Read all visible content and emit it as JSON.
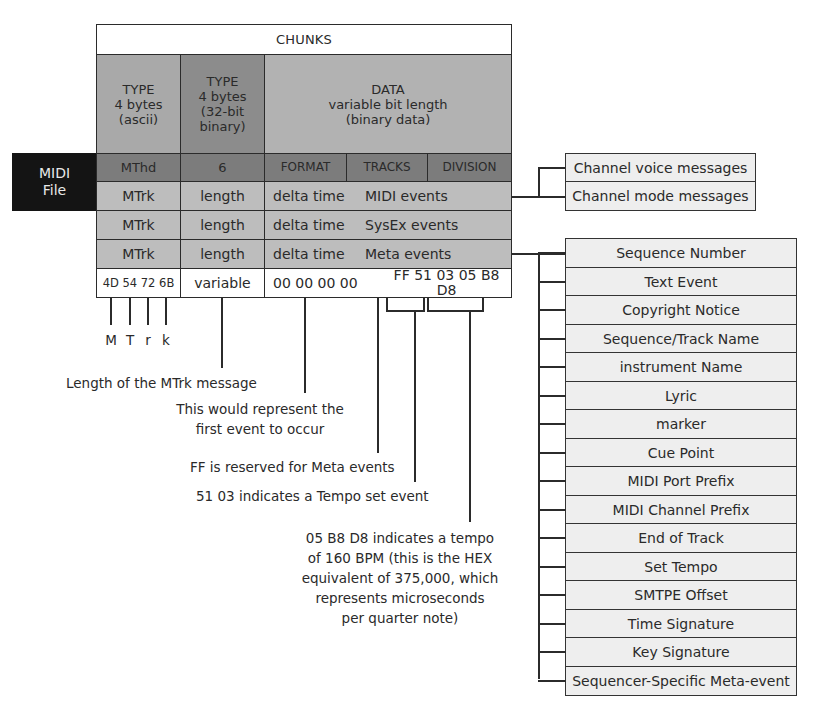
{
  "title": "CHUNKS",
  "midi_file_label": [
    "MIDI",
    "File"
  ],
  "columns": {
    "type_ascii": [
      "TYPE",
      "4 bytes",
      "(ascii)"
    ],
    "type_binary": [
      "TYPE",
      "4 bytes",
      "(32-bit",
      "binary)"
    ],
    "data": [
      "DATA",
      "variable bit length",
      "(binary data)"
    ]
  },
  "header_row": {
    "type": "MThd",
    "length": "6",
    "format": "FORMAT",
    "tracks": "TRACKS",
    "division": "DIVISION"
  },
  "track_rows": [
    {
      "type": "MTrk",
      "length": "length",
      "delta": "delta time",
      "events": "MIDI events"
    },
    {
      "type": "MTrk",
      "length": "length",
      "delta": "delta time",
      "events": "SysEx events"
    },
    {
      "type": "MTrk",
      "length": "length",
      "delta": "delta time",
      "events": "Meta events"
    }
  ],
  "hex_row": {
    "type": "4D 54 72 6B",
    "length": "variable",
    "delta": "00 00 00 00",
    "events": "FF 51 03 05 B8 D8"
  },
  "mtrk_letters": [
    "M",
    "T",
    "r",
    "k"
  ],
  "annotations": {
    "length": "Length of the MTrk message",
    "first_event": [
      "This would represent the",
      "first event to occur"
    ],
    "ff": "FF is reserved for Meta events",
    "tempo_set": "51 03 indicates a Tempo set event",
    "tempo_value": [
      "05 B8 D8 indicates a tempo",
      "of 160 BPM (this is the HEX",
      "equivalent of 375,000, which",
      "represents microseconds",
      "per quarter note)"
    ]
  },
  "channel_messages": [
    "Channel voice messages",
    "Channel mode messages"
  ],
  "meta_events": [
    "Sequence Number",
    "Text Event",
    "Copyright Notice",
    "Sequence/Track Name",
    "instrument Name",
    "Lyric",
    "marker",
    "Cue Point",
    "MIDI Port Prefix",
    "MIDI Channel Prefix",
    "End of Track",
    "Set Tempo",
    "SMTPE Offset",
    "Time Signature",
    "Key Signature",
    "Sequencer-Specific Meta-event"
  ],
  "colors": {
    "mthd_row": "#7c7c7c",
    "mtrk_row": "#bdbdbd",
    "midi_file_box": "#141414",
    "meta_box": "#eeeeee"
  }
}
